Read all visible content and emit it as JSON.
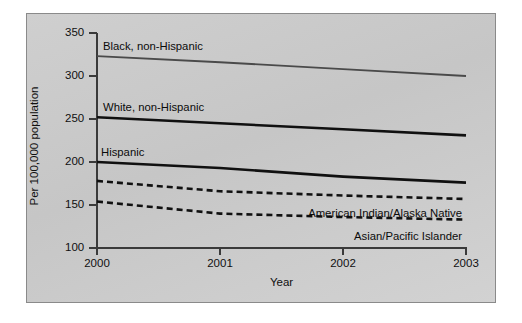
{
  "chart_data": {
    "type": "line",
    "title": "",
    "xlabel": "Year",
    "ylabel": "Per 100,000 population",
    "x": [
      2000,
      2001,
      2002,
      2003
    ],
    "xtick_labels": [
      "2000",
      "2001",
      "2002",
      "2003"
    ],
    "ytick_labels": [
      "100",
      "150",
      "200",
      "250",
      "300",
      "350"
    ],
    "ytick_values": [
      100,
      150,
      200,
      250,
      300,
      350
    ],
    "ylim": [
      100,
      350
    ],
    "xlim": [
      2000,
      2003
    ],
    "grid": false,
    "legend_position": "inline-labels",
    "series": [
      {
        "name": "Black, non-Hispanic",
        "label": "Black, non-Hispanic",
        "style": "solid",
        "color": "#4a4a4a",
        "width": 1.8,
        "values": [
          323,
          316,
          308,
          300
        ]
      },
      {
        "name": "White, non-Hispanic",
        "label": "White, non-Hispanic",
        "style": "solid",
        "color": "#101010",
        "width": 2.6,
        "values": [
          252,
          245,
          238,
          231
        ]
      },
      {
        "name": "Hispanic",
        "label": "Hispanic",
        "style": "solid",
        "color": "#101010",
        "width": 2.6,
        "values": [
          200,
          193,
          183,
          176
        ]
      },
      {
        "name": "American Indian/Alaska Native",
        "label": "American Indian/Alaska Native",
        "style": "dashed",
        "color": "#101010",
        "width": 2.6,
        "values": [
          178,
          166,
          161,
          157
        ]
      },
      {
        "name": "Asian/Pacific Islander",
        "label": "Asian/Pacific Islander",
        "style": "dashed",
        "color": "#101010",
        "width": 2.6,
        "values": [
          154,
          140,
          136,
          133
        ]
      }
    ],
    "annotations": [
      {
        "text": "Black, non-Hispanic",
        "near_series": "Black, non-Hispanic"
      },
      {
        "text": "White, non-Hispanic",
        "near_series": "White, non-Hispanic"
      },
      {
        "text": "Hispanic",
        "near_series": "Hispanic"
      },
      {
        "text": "American Indian/Alaska Native",
        "near_series": "American Indian/Alaska Native"
      },
      {
        "text": "Asian/Pacific Islander",
        "near_series": "Asian/Pacific Islander"
      }
    ]
  },
  "figure": {
    "panel_background": "#cccccc",
    "panel_border": "#8a8a8a",
    "page_background": "#ffffff",
    "ink": "#101010"
  }
}
